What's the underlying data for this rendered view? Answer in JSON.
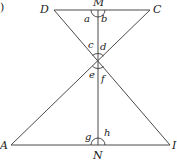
{
  "figure": {
    "fragment_label": ")",
    "points": {
      "D": "D",
      "M": "M",
      "C": "C",
      "A": "A",
      "N": "N",
      "B": "I"
    },
    "angles": {
      "a": "a",
      "b": "b",
      "c": "c",
      "d": "d",
      "e": "e",
      "f": "f",
      "g": "g",
      "h": "h"
    }
  }
}
